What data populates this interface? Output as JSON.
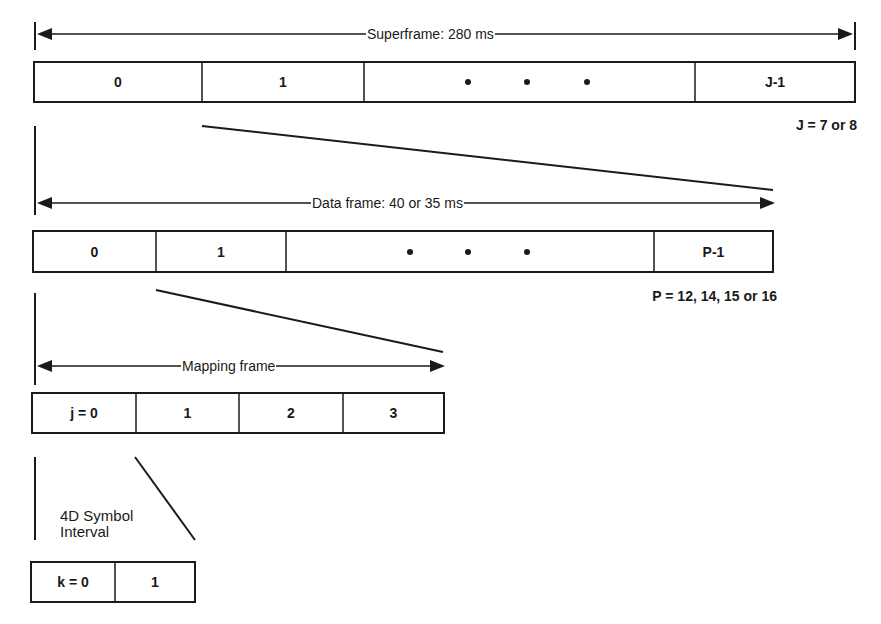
{
  "diagram": {
    "superframe": {
      "label": "Superframe: 280 ms",
      "cells": [
        "0",
        "1",
        "J-1"
      ],
      "ellipsis": "• • •",
      "note": "J = 7 or 8"
    },
    "data_frame": {
      "label": "Data frame: 40 or 35 ms",
      "cells": [
        "0",
        "1",
        "P-1"
      ],
      "ellipsis": "• • •",
      "note": "P = 12, 14, 15 or 16"
    },
    "mapping_frame": {
      "label": "Mapping frame",
      "cells": [
        "j = 0",
        "1",
        "2",
        "3"
      ]
    },
    "symbol_interval": {
      "label_line1": "4D Symbol",
      "label_line2": "Interval",
      "cells": [
        "k = 0",
        "1"
      ]
    }
  }
}
